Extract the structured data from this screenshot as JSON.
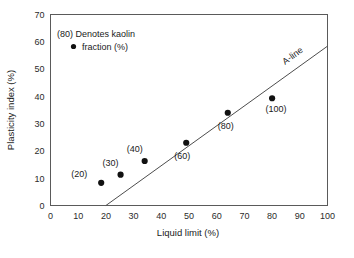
{
  "chart_data": {
    "type": "scatter",
    "title": "",
    "xlabel": "Liquid limit (%)",
    "ylabel": "Plasticity index (%)",
    "xlim": [
      0,
      100
    ],
    "ylim": [
      0,
      70
    ],
    "xticks": [
      "0",
      "10",
      "20",
      "30",
      "40",
      "50",
      "60",
      "70",
      "80",
      "90",
      "100"
    ],
    "yticks": [
      "0",
      "10",
      "20",
      "30",
      "40",
      "50",
      "60",
      "70"
    ],
    "grid": false,
    "legend_position": "upper-left",
    "legend_lines": [
      "(80) Denotes kaolin",
      "fraction (%)"
    ],
    "legend_marker": "filled-circle",
    "series": [
      {
        "name": "Kaolin fraction samples",
        "marker": "filled-circle",
        "points": [
          {
            "label": "(20)",
            "x": 18.3,
            "y": 8.3,
            "label_dx": -22,
            "label_dy": -6
          },
          {
            "label": "(30)",
            "x": 25.3,
            "y": 11.3,
            "label_dx": -10,
            "label_dy": -9
          },
          {
            "label": "(40)",
            "x": 34.0,
            "y": 16.3,
            "label_dx": -10,
            "label_dy": -9
          },
          {
            "label": "(60)",
            "x": 49.0,
            "y": 23.0,
            "label_dx": -4,
            "label_dy": 16
          },
          {
            "label": "(80)",
            "x": 64.0,
            "y": 34.0,
            "label_dx": -2,
            "label_dy": 16
          },
          {
            "label": "(100)",
            "x": 80.0,
            "y": 39.3,
            "label_dx": 4,
            "label_dy": 14
          }
        ]
      }
    ],
    "annotations": [
      {
        "name": "a-line",
        "text": "A-line",
        "type": "line",
        "equation": "PI = 0.73 (LL - 20)",
        "x_start": 20,
        "y_start": 0,
        "x_end": 100,
        "y_end": 58.4,
        "label_x": 88,
        "label_y": 54
      }
    ],
    "colors": {
      "marker": "#111111",
      "axis": "#5a5a5a",
      "aline": "#4d4d4d",
      "text": "#1a1a1a",
      "background": "#ffffff"
    }
  }
}
